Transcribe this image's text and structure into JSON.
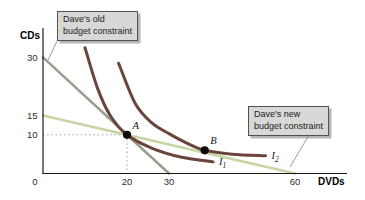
{
  "callouts": {
    "old": {
      "line1": "Dave's old",
      "line2": "budget constraint"
    },
    "new": {
      "line1": "Dave's new",
      "line2": "budget constraint"
    }
  },
  "chart_data": {
    "type": "line",
    "title": "",
    "xlabel": "DVDs",
    "ylabel": "CDs",
    "xlim": [
      0,
      72
    ],
    "ylim": [
      0,
      38
    ],
    "grid": false,
    "x_ticks": [
      0,
      20,
      30,
      60
    ],
    "y_ticks": [
      30,
      15,
      10
    ],
    "series": [
      {
        "name": "Dave's old budget constraint",
        "kind": "line",
        "color": "#95a18e",
        "width": 2.6,
        "points": [
          [
            0,
            30
          ],
          [
            30,
            0
          ]
        ]
      },
      {
        "name": "Dave's new budget constraint",
        "kind": "line",
        "color": "#c6d6a2",
        "width": 2.6,
        "points": [
          [
            0,
            15
          ],
          [
            60,
            0
          ]
        ]
      },
      {
        "name": "I1",
        "label_main": "I",
        "label_sub": "1",
        "kind": "curve",
        "color": "#6d443c",
        "width": 3,
        "points": [
          [
            10,
            32.5
          ],
          [
            13,
            22
          ],
          [
            16,
            15
          ],
          [
            20,
            10
          ],
          [
            26,
            6.5
          ],
          [
            33,
            4.2
          ],
          [
            40.5,
            3
          ]
        ]
      },
      {
        "name": "I2",
        "label_main": "I",
        "label_sub": "2",
        "kind": "curve",
        "color": "#6d443c",
        "width": 3,
        "points": [
          [
            18,
            28.5
          ],
          [
            22,
            18
          ],
          [
            26,
            13
          ],
          [
            30,
            10.3
          ],
          [
            34,
            8
          ],
          [
            38.5,
            6
          ],
          [
            45,
            5
          ],
          [
            53,
            4.6
          ]
        ]
      }
    ],
    "points": [
      {
        "label": "A",
        "x": 20,
        "y": 10,
        "guides": true
      },
      {
        "label": "B",
        "x": 38.5,
        "y": 6,
        "guides": false
      }
    ]
  }
}
